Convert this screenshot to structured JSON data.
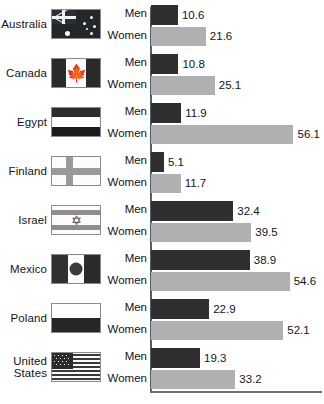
{
  "chart_data": {
    "type": "bar",
    "title": "",
    "subtitle": "",
    "xlabel": "",
    "ylabel": "",
    "orientation": "horizontal",
    "grid": false,
    "legend_position": "inline-row-labels",
    "xlim": [
      0,
      60
    ],
    "series_names": [
      "Men",
      "Women"
    ],
    "series_colors": [
      "#2f2f2f",
      "#b0b0b0"
    ],
    "categories": [
      "Australia",
      "Canada",
      "Egypt",
      "Finland",
      "Israel",
      "Mexico",
      "Poland",
      "United States"
    ],
    "series": [
      {
        "name": "Men",
        "values": [
          10.6,
          10.8,
          11.9,
          5.1,
          32.4,
          38.9,
          22.9,
          19.3
        ]
      },
      {
        "name": "Women",
        "values": [
          21.6,
          25.1,
          56.1,
          11.7,
          39.5,
          54.6,
          52.1,
          33.2
        ]
      }
    ],
    "rows": [
      {
        "country": "Australia",
        "country_lines": [
          "Australia"
        ],
        "flag": "flag-australia",
        "men_label": "Men",
        "men_value": 10.6,
        "men_value_text": "10.6",
        "women_label": "Women",
        "women_value": 21.6,
        "women_value_text": "21.6"
      },
      {
        "country": "Canada",
        "country_lines": [
          "Canada"
        ],
        "flag": "flag-canada",
        "men_label": "Men",
        "men_value": 10.8,
        "men_value_text": "10.8",
        "women_label": "Women",
        "women_value": 25.1,
        "women_value_text": "25.1"
      },
      {
        "country": "Egypt",
        "country_lines": [
          "Egypt"
        ],
        "flag": "flag-egypt",
        "men_label": "Men",
        "men_value": 11.9,
        "men_value_text": "11.9",
        "women_label": "Women",
        "women_value": 56.1,
        "women_value_text": "56.1"
      },
      {
        "country": "Finland",
        "country_lines": [
          "Finland"
        ],
        "flag": "flag-finland",
        "men_label": "Men",
        "men_value": 5.1,
        "men_value_text": "5.1",
        "women_label": "Women",
        "women_value": 11.7,
        "women_value_text": "11.7"
      },
      {
        "country": "Israel",
        "country_lines": [
          "Israel"
        ],
        "flag": "flag-israel",
        "men_label": "Men",
        "men_value": 32.4,
        "men_value_text": "32.4",
        "women_label": "Women",
        "women_value": 39.5,
        "women_value_text": "39.5"
      },
      {
        "country": "Mexico",
        "country_lines": [
          "Mexico"
        ],
        "flag": "flag-mexico",
        "men_label": "Men",
        "men_value": 38.9,
        "men_value_text": "38.9",
        "women_label": "Women",
        "women_value": 54.6,
        "women_value_text": "54.6"
      },
      {
        "country": "Poland",
        "country_lines": [
          "Poland"
        ],
        "flag": "flag-poland",
        "men_label": "Men",
        "men_value": 22.9,
        "men_value_text": "22.9",
        "women_label": "Women",
        "women_value": 52.1,
        "women_value_text": "52.1"
      },
      {
        "country": "United States",
        "country_lines": [
          "United",
          "States"
        ],
        "flag": "flag-united-states",
        "men_label": "Men",
        "men_value": 19.3,
        "men_value_text": "19.3",
        "women_label": "Women",
        "women_value": 33.2,
        "women_value_text": "33.2"
      }
    ],
    "axis": {
      "baseline_color": "#555e63",
      "bottom_rule_color": "#6a7377",
      "px_per_unit": 2.54
    }
  }
}
